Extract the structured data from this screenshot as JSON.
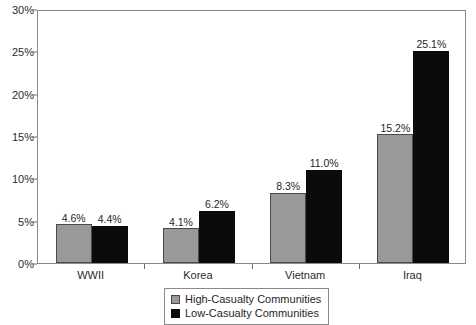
{
  "chart_data": {
    "type": "bar",
    "title": "",
    "subtitle": "",
    "xlabel": "",
    "ylabel": "",
    "categories": [
      "WWII",
      "Korea",
      "Vietnam",
      "Iraq"
    ],
    "series": [
      {
        "name": "High-Casualty Communities",
        "color": "#999999",
        "values": [
          4.6,
          4.1,
          8.3,
          15.2
        ],
        "labels": [
          "4.6%",
          "4.1%",
          "8.3%",
          "15.2%"
        ]
      },
      {
        "name": "Low-Casualty Communities",
        "color": "#0b0b0b",
        "values": [
          4.4,
          6.2,
          11.0,
          25.1
        ],
        "labels": [
          "4.4%",
          "6.2%",
          "11.0%",
          "25.1%"
        ]
      }
    ],
    "ylim": [
      0,
      30
    ],
    "y_ticks": [
      0,
      5,
      10,
      15,
      20,
      25,
      30
    ],
    "y_tick_labels": [
      "0%",
      "5%",
      "10%",
      "15%",
      "20%",
      "25%",
      "30%"
    ],
    "grid": false,
    "legend_position": "bottom-center"
  },
  "legend": {
    "entries": [
      {
        "label": "High-Casualty Communities"
      },
      {
        "label": "Low-Casualty Communities"
      }
    ]
  }
}
